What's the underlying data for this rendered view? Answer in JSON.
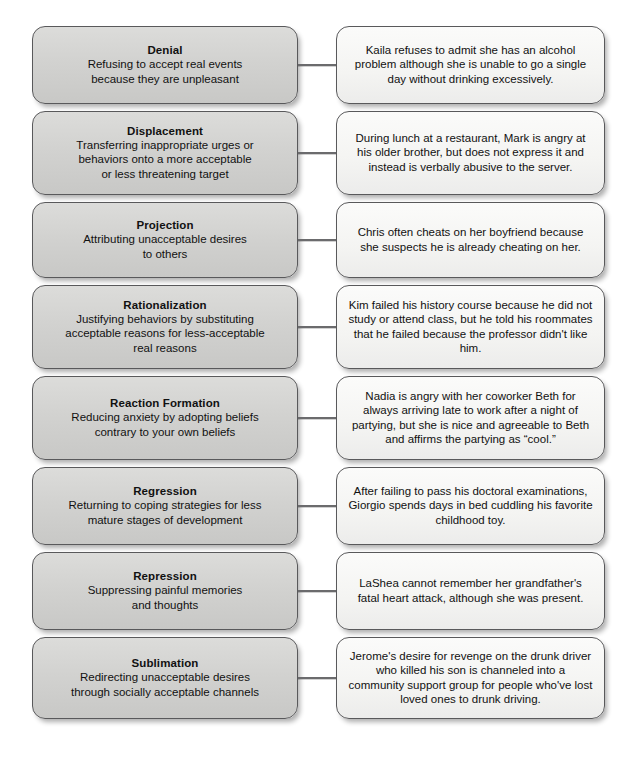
{
  "diagram": {
    "colors": {
      "term_box_fill": "#d2d2d0",
      "example_box_fill": "#f4f4f2",
      "box_border": "#59595b",
      "connector": "#6b6b6d",
      "text": "#111111",
      "page_background": "#ffffff"
    },
    "rows": [
      {
        "term": "Denial",
        "description": "Refusing to accept real events\nbecause they are unpleasant",
        "example": "Kaila refuses to admit she has an alcohol problem although she is unable to go a single day without drinking excessively."
      },
      {
        "term": "Displacement",
        "description": "Transferring inappropriate urges or\nbehaviors onto a more acceptable\nor less threatening target",
        "example": "During lunch at a restaurant, Mark is angry at his older brother, but does not express it and instead is verbally abusive to the server."
      },
      {
        "term": "Projection",
        "description": "Attributing unacceptable desires\nto others",
        "example": "Chris often cheats on her boyfriend because she suspects he is already cheating on her."
      },
      {
        "term": "Rationalization",
        "description": "Justifying behaviors by substituting\nacceptable reasons for less-acceptable\nreal reasons",
        "example": "Kim failed his history course because he did not study or attend class, but he told his roommates that he failed because the professor didn't like him."
      },
      {
        "term": "Reaction Formation",
        "description": "Reducing anxiety by adopting beliefs\ncontrary to your own beliefs",
        "example": "Nadia is angry with her coworker Beth for always arriving late to work after a night of partying, but she is nice and agreeable to Beth and affirms the partying as “cool.”"
      },
      {
        "term": "Regression",
        "description": "Returning to coping strategies for less\nmature stages of development",
        "example": "After failing to pass his doctoral examinations, Giorgio spends days in bed cuddling his favorite childhood toy."
      },
      {
        "term": "Repression",
        "description": "Suppressing painful memories\nand thoughts",
        "example": "LaShea cannot remember her grandfather's fatal heart attack, although she was present."
      },
      {
        "term": "Sublimation",
        "description": "Redirecting unacceptable desires\nthrough socially acceptable channels",
        "example": "Jerome's desire for revenge on the drunk driver who killed his son is channeled into a community support group for people who've lost loved ones to drunk driving."
      }
    ]
  }
}
